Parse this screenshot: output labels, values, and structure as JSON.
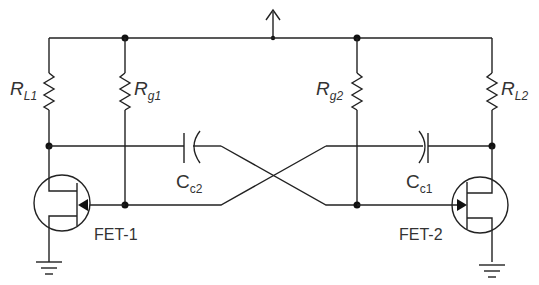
{
  "diagram": {
    "type": "astable multivibrator (cross-coupled FET)",
    "supply": {
      "symbol": "up-arrow",
      "label": ""
    },
    "components": {
      "RL1": {
        "main": "R",
        "sub": "L1"
      },
      "Rg1": {
        "main": "R",
        "sub": "g1"
      },
      "Rg2": {
        "main": "R",
        "sub": "g2"
      },
      "RL2": {
        "main": "R",
        "sub": "L2"
      },
      "Cc2": {
        "main": "C",
        "sub": "c2"
      },
      "Cc1": {
        "main": "C",
        "sub": "c1"
      },
      "FET1": {
        "label": "FET-1"
      },
      "FET2": {
        "label": "FET-2"
      }
    },
    "colors": {
      "stroke": "#222222",
      "text": "#333333",
      "background": "#ffffff"
    }
  }
}
